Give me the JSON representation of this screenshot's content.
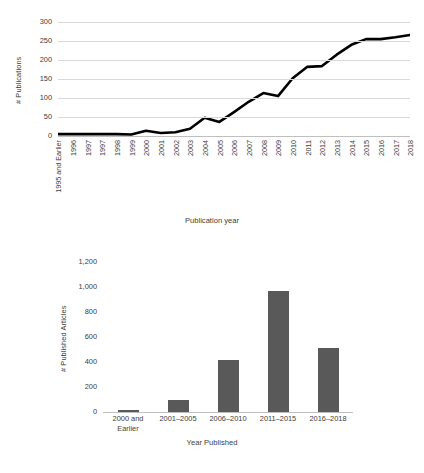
{
  "chart_data": [
    {
      "type": "line",
      "title": "",
      "xlabel": "Publication year",
      "ylabel": "# Publications",
      "ylim": [
        0,
        300
      ],
      "yticks": [
        "0",
        "50",
        "100",
        "150",
        "200",
        "250",
        "300"
      ],
      "ytick_values": [
        0,
        50,
        100,
        150,
        200,
        250,
        300
      ],
      "grid": true,
      "legend": "none",
      "line_color": "#000000",
      "categories": [
        "1995 and Earlier",
        "1996",
        "1997",
        "1997",
        "1998",
        "1999",
        "2000",
        "2001",
        "2002",
        "2003",
        "2004",
        "2005",
        "2006",
        "2007",
        "2008",
        "2009",
        "2010",
        "2011",
        "2012",
        "2013",
        "2014",
        "2015",
        "2016",
        "2017",
        "2018"
      ],
      "values": [
        5,
        5,
        5,
        5,
        5,
        4,
        14,
        8,
        10,
        19,
        48,
        37,
        63,
        90,
        113,
        105,
        152,
        182,
        184,
        214,
        240,
        255,
        255,
        260,
        266
      ]
    },
    {
      "type": "bar",
      "title": "",
      "xlabel": "Year Published",
      "ylabel": "# Published Articles",
      "ylim": [
        0,
        1200
      ],
      "yticks": [
        "0",
        "200",
        "400",
        "600",
        "800",
        "1,000",
        "1,200"
      ],
      "ytick_values": [
        0,
        200,
        400,
        600,
        800,
        1000,
        1200
      ],
      "grid": false,
      "legend": "none",
      "bar_color": "#595959",
      "categories": [
        "2000 and Earlier",
        "2001–2005",
        "2006–2010",
        "2011–2015",
        "2016–2018"
      ],
      "values": [
        15,
        95,
        415,
        970,
        510
      ]
    }
  ]
}
